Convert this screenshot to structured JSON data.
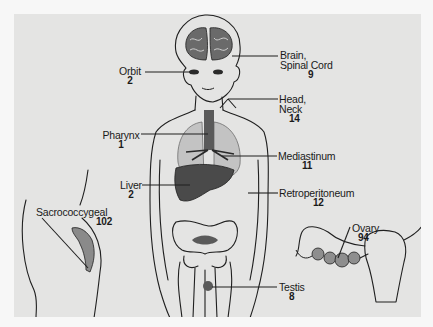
{
  "figure": {
    "type": "anatomical-diagram",
    "colors": {
      "background": "#e4e4e3",
      "outer": "#f7f7f7",
      "line": "#1f1f1f",
      "organ_dark": "#4a4a4a",
      "organ_mid": "#8a8a8a",
      "organ_light": "#c8c8c8"
    },
    "labels": [
      {
        "id": "brain",
        "name_lines": [
          "Brain,",
          "Spinal Cord"
        ],
        "count": "9"
      },
      {
        "id": "orbit",
        "name_lines": [
          "Orbit"
        ],
        "count": "2"
      },
      {
        "id": "head-neck",
        "name_lines": [
          "Head,",
          "Neck"
        ],
        "count": "14"
      },
      {
        "id": "pharynx",
        "name_lines": [
          "Pharynx"
        ],
        "count": "1"
      },
      {
        "id": "mediastinum",
        "name_lines": [
          "Mediastinum"
        ],
        "count": "11"
      },
      {
        "id": "liver",
        "name_lines": [
          "Liver"
        ],
        "count": "2"
      },
      {
        "id": "retroperitoneum",
        "name_lines": [
          "Retroperitoneum"
        ],
        "count": "12"
      },
      {
        "id": "sacrococcygeal",
        "name_lines": [
          "Sacrococcygeal"
        ],
        "count": "102"
      },
      {
        "id": "ovary",
        "name_lines": [
          "Ovary"
        ],
        "count": "94"
      },
      {
        "id": "testis",
        "name_lines": [
          "Testis"
        ],
        "count": "8"
      }
    ]
  }
}
